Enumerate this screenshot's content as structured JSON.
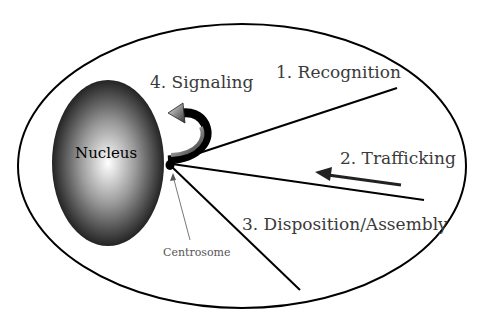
{
  "diagram": {
    "cell_label": "",
    "nucleus": {
      "label": "Nucleus"
    },
    "centrosome": {
      "label": "Centrosome"
    },
    "steps": [
      {
        "label": "1. Recognition"
      },
      {
        "label": "2. Trafficking"
      },
      {
        "label": "3. Disposition/Assembly"
      },
      {
        "label": "4. Signaling"
      }
    ],
    "colors": {
      "outline": "#000000",
      "nucleus_dark": "#111111",
      "nucleus_light": "#ffffff",
      "text": "#3a3a3a"
    }
  }
}
